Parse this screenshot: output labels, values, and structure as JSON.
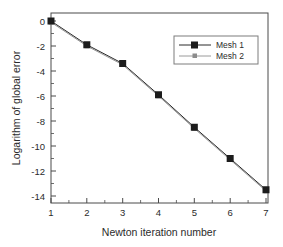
{
  "chart_data": {
    "type": "line",
    "title": "",
    "xlabel": "Newton iteration number",
    "ylabel": "Logarithm of global error",
    "x": [
      1,
      2,
      3,
      4,
      5,
      6,
      7
    ],
    "xlim": [
      1,
      7
    ],
    "ylim": [
      -15,
      0.8
    ],
    "xticks": [
      "1",
      "2",
      "3",
      "4",
      "5",
      "6",
      "7"
    ],
    "yticks": [
      "0",
      "-2",
      "-4",
      "-6",
      "-8",
      "-10",
      "-12",
      "-14"
    ],
    "ytick_values": [
      0,
      -2,
      -4,
      -6,
      -8,
      -10,
      -12,
      -14
    ],
    "grid": false,
    "legend_position": "upper right",
    "minor_ticks": true,
    "series": [
      {
        "name": "Mesh 1",
        "color": "#1c1c1c",
        "marker": "filled-square",
        "values": [
          0,
          -1.9,
          -3.4,
          -5.9,
          -8.5,
          -11.0,
          -13.5
        ]
      },
      {
        "name": "Mesh 2",
        "color": "#8c8c8c",
        "marker": "filled-square-small",
        "values": [
          -0.1,
          -2.0,
          -3.5,
          -6.0,
          -8.6,
          -11.1,
          -13.6
        ]
      }
    ]
  },
  "axes": {
    "x_title": "Newton iteration number",
    "y_title": "Logarithm of global error",
    "x_tick_labels": [
      "1",
      "2",
      "3",
      "4",
      "5",
      "6",
      "7"
    ],
    "y_tick_labels": [
      "0",
      "-2",
      "-4",
      "-6",
      "-8",
      "-10",
      "-12",
      "-14"
    ]
  },
  "legend": {
    "entries": [
      {
        "label": "Mesh 1"
      },
      {
        "label": "Mesh 2"
      }
    ]
  }
}
